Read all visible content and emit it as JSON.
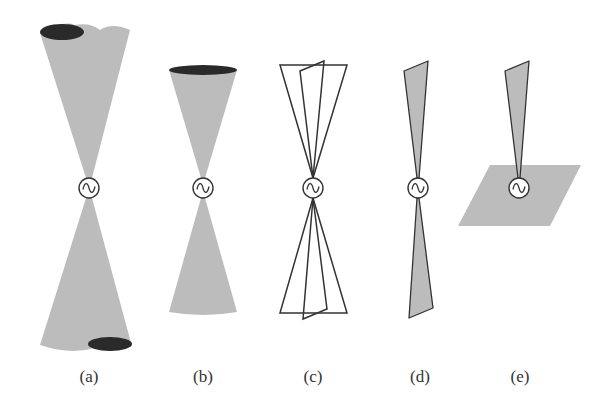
{
  "figure": {
    "colors": {
      "beam_fill": "#bcbcbc",
      "lobe_dark": "#2a2a2a",
      "stroke": "#333333",
      "background": "#ffffff"
    },
    "panels": [
      {
        "id": "a",
        "label": "(a)",
        "shape": "double cone, wide, with two dark lobe ellipses at opposite rims",
        "source_symbol": "~"
      },
      {
        "id": "b",
        "label": "(b)",
        "shape": "double cone, narrower, dark rim on top",
        "source_symbol": "~"
      },
      {
        "id": "c",
        "label": "(c)",
        "shape": "outlined double triangles / fan beams, overlapping",
        "source_symbol": "~"
      },
      {
        "id": "d",
        "label": "(d)",
        "shape": "thin grey filled fan beam above and below",
        "source_symbol": "~"
      },
      {
        "id": "e",
        "label": "(e)",
        "shape": "single upward thin fan beam above a grey ground plane parallelogram",
        "source_symbol": "~"
      }
    ]
  }
}
